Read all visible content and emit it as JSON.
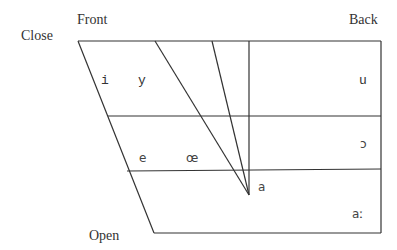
{
  "diagram": {
    "labels": {
      "front": "Front",
      "back": "Back",
      "close": "Close",
      "open": "Open"
    },
    "colors": {
      "line": "#333333",
      "text": "#333333",
      "background": "#ffffff"
    },
    "vowels": [
      {
        "symbol": "i",
        "x": 101,
        "y": 84,
        "style": "mono"
      },
      {
        "symbol": "y",
        "x": 141,
        "y": 84,
        "style": "mono"
      },
      {
        "symbol": "u",
        "x": 362,
        "y": 84,
        "style": "mono"
      },
      {
        "symbol": "e",
        "x": 143,
        "y": 162,
        "style": "sans"
      },
      {
        "symbol": "œ",
        "x": 190,
        "y": 162,
        "style": "sans"
      },
      {
        "symbol": "ɔ",
        "x": 362,
        "y": 147,
        "style": "sans"
      },
      {
        "symbol": "a",
        "x": 258,
        "y": 191,
        "style": "sans"
      },
      {
        "symbol": "aː",
        "x": 353,
        "y": 217,
        "style": "sans"
      }
    ]
  }
}
